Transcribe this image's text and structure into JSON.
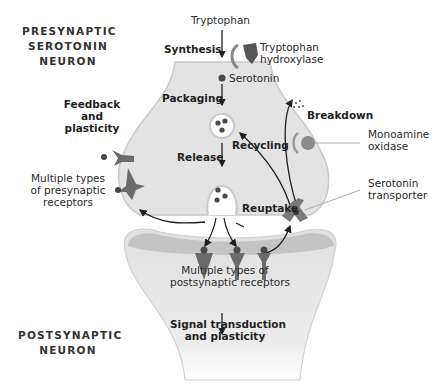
{
  "title_pre": [
    "PRESYNAPTIC",
    "SEROTONIN",
    "NEURON"
  ],
  "title_post": [
    "POSTSYNAPTIC",
    "NEURON"
  ],
  "labels": {
    "tryptophan": "Tryptophan",
    "synthesis": "Synthesis",
    "enzyme": [
      "Tryptophan",
      "hydroxylase"
    ],
    "serotonin": "Serotonin",
    "packaging": "Packaging",
    "release": "Release",
    "recycling": "Recycling",
    "breakdown": "Breakdown",
    "mao": [
      "Monoamine",
      "oxidase"
    ],
    "transporter": [
      "Serotonin",
      "transporter"
    ],
    "reuptake": "Reuptake",
    "feedback": [
      "Feedback",
      "and",
      "plasticity"
    ],
    "presyn_receptors": [
      "Multiple types",
      "of presynaptic",
      "receptors"
    ],
    "postsyn_receptors": [
      "Multiple types of",
      "postsynaptic receptors"
    ],
    "signal": [
      "Signal transduction",
      "and plasticity"
    ]
  },
  "colors": {
    "neuron_fill": "#e3e3e3",
    "neuron_edge": "#c9c9c9",
    "membrane_band": "#c4c4c4",
    "receptor": "#6b6b6b",
    "dot": "#4a4a4a",
    "arrow": "#1f1f1f"
  }
}
